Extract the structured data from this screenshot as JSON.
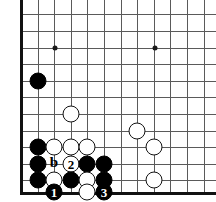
{
  "figure": {
    "kind": "go-board-diagram",
    "width": 216,
    "height": 202,
    "board_background": "#ffffff",
    "line_color": "#5a5a5a",
    "edge_color": "#111111",
    "black_color": "#000000",
    "white_color": "#ffffff"
  },
  "geometry": {
    "origin_x": 21,
    "origin_y": 14,
    "spacing": 16.6,
    "columns": 12,
    "rows": 11,
    "left_edge_x": 21,
    "bottom_edge_y": 192,
    "stone_diameter": 17
  },
  "grid": {
    "vertical_x": [
      21,
      38,
      54,
      71,
      87,
      104,
      121,
      137,
      154,
      170,
      187,
      204
    ],
    "horizontal_y": [
      14,
      31,
      48,
      64,
      81,
      97,
      114,
      131,
      147,
      164,
      180,
      192
    ]
  },
  "star_points": [
    {
      "name": "star-point-upper-left",
      "x": 55,
      "y": 48
    },
    {
      "name": "star-point-upper-right",
      "x": 155,
      "y": 48
    },
    {
      "name": "star-point-lower-right",
      "x": 155,
      "y": 147
    }
  ],
  "stones": [
    {
      "name": "black-stone-corner-approach",
      "color": "black",
      "x": 38,
      "y": 81,
      "label": ""
    },
    {
      "name": "white-stone-center",
      "color": "white",
      "x": 71,
      "y": 114,
      "label": ""
    },
    {
      "name": "white-stone-right-upper",
      "color": "white",
      "x": 137,
      "y": 131,
      "label": ""
    },
    {
      "name": "black-stone-left-wall-top",
      "color": "black",
      "x": 38,
      "y": 147,
      "label": ""
    },
    {
      "name": "white-stone-row-a",
      "color": "white",
      "x": 54,
      "y": 147,
      "label": ""
    },
    {
      "name": "white-stone-row-b",
      "color": "white",
      "x": 71,
      "y": 147,
      "label": ""
    },
    {
      "name": "white-stone-row-c",
      "color": "white",
      "x": 87,
      "y": 147,
      "label": ""
    },
    {
      "name": "white-stone-right-middle",
      "color": "white",
      "x": 154,
      "y": 147,
      "label": ""
    },
    {
      "name": "black-stone-left-wall-middle",
      "color": "black",
      "x": 38,
      "y": 164,
      "label": ""
    },
    {
      "name": "white-stone-move-2",
      "color": "white",
      "x": 71,
      "y": 164,
      "label": "2"
    },
    {
      "name": "black-stone-cut-left",
      "color": "black",
      "x": 87,
      "y": 164,
      "label": ""
    },
    {
      "name": "black-stone-cut-right",
      "color": "black",
      "x": 104,
      "y": 164,
      "label": ""
    },
    {
      "name": "black-stone-left-wall-bottom",
      "color": "black",
      "x": 38,
      "y": 180,
      "label": ""
    },
    {
      "name": "white-stone-second-line-left",
      "color": "white",
      "x": 54,
      "y": 180,
      "label": ""
    },
    {
      "name": "black-stone-second-line",
      "color": "black",
      "x": 71,
      "y": 180,
      "label": ""
    },
    {
      "name": "white-stone-second-line-right",
      "color": "white",
      "x": 87,
      "y": 180,
      "label": ""
    },
    {
      "name": "black-stone-second-line-far",
      "color": "black",
      "x": 104,
      "y": 180,
      "label": ""
    },
    {
      "name": "white-stone-right-lower",
      "color": "white",
      "x": 154,
      "y": 180,
      "label": ""
    },
    {
      "name": "black-stone-move-1",
      "color": "black",
      "x": 54,
      "y": 192,
      "label": "1"
    },
    {
      "name": "white-stone-first-line",
      "color": "white",
      "x": 87,
      "y": 192,
      "label": ""
    },
    {
      "name": "black-stone-move-3",
      "color": "black",
      "x": 104,
      "y": 192,
      "label": "3"
    }
  ],
  "point_labels": [
    {
      "name": "point-label-b",
      "text": "b",
      "x": 54,
      "y": 162
    },
    {
      "name": "point-label-a",
      "text": "a",
      "x": 38,
      "y": 179
    }
  ]
}
